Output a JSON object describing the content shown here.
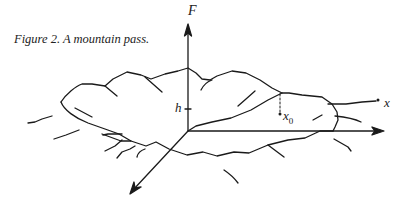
{
  "figure": {
    "caption": "Figure 2.  A mountain pass.",
    "labels": {
      "vertical_axis": "F",
      "height_marker": "h",
      "point_x0_base": "x",
      "point_x0_sub": "0",
      "point_x": "x"
    },
    "colors": {
      "ink": "#1a1a1a",
      "background": "#ffffff"
    }
  }
}
